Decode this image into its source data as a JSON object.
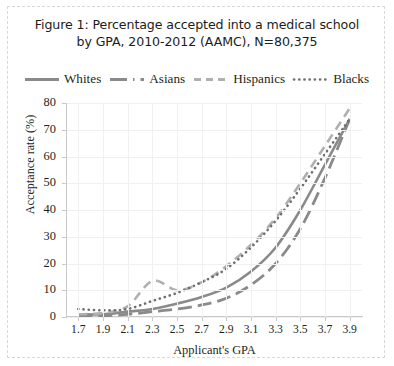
{
  "figure": {
    "title_line1": "Figure 1: Percentage accepted into a medical school",
    "title_line2": "by GPA, 2010-2012 (AAMC), N=80,375",
    "border_color": "#d8d8d8",
    "background": "#ffffff"
  },
  "chart_data": {
    "type": "line",
    "title": "Figure 1: Percentage accepted into a medical school by GPA, 2010-2012 (AAMC), N=80,375",
    "xlabel": "Applicant's GPA",
    "ylabel": "Acceptance rate (%)",
    "xlim": [
      1.6,
      4.0
    ],
    "ylim": [
      0,
      80
    ],
    "yticks": [
      0,
      10,
      20,
      30,
      40,
      50,
      60,
      70,
      80
    ],
    "xticks": [
      "1.7",
      "1.9",
      "2.1",
      "2.3",
      "2.5",
      "2.7",
      "2.9",
      "3.1",
      "3.3",
      "3.5",
      "3.7",
      "3.9"
    ],
    "x": [
      1.7,
      1.9,
      2.1,
      2.3,
      2.5,
      2.7,
      2.9,
      3.1,
      3.3,
      3.5,
      3.7,
      3.9
    ],
    "grid": true,
    "legend_position": "top",
    "series": [
      {
        "name": "Whites",
        "style": "solid",
        "color": "#8a8a8a",
        "values": [
          1.0,
          1.0,
          2.0,
          3.0,
          5.0,
          7.5,
          11.0,
          17.0,
          26.0,
          40.0,
          57.0,
          74.0
        ]
      },
      {
        "name": "Asians",
        "style": "dash-dot",
        "color": "#8a8a8a",
        "values": [
          0.5,
          0.5,
          1.0,
          2.0,
          3.0,
          4.5,
          7.0,
          12.0,
          20.0,
          33.0,
          52.0,
          74.0
        ]
      },
      {
        "name": "Hispanics",
        "style": "dashed",
        "color": "#b0b0b0",
        "values": [
          1.0,
          1.5,
          4.0,
          13.5,
          10.0,
          13.0,
          19.0,
          27.0,
          37.0,
          50.0,
          64.0,
          78.0
        ]
      },
      {
        "name": "Blacks",
        "style": "dotted",
        "color": "#6f6f6f",
        "values": [
          3.0,
          2.5,
          3.0,
          6.0,
          9.0,
          13.0,
          18.0,
          26.0,
          36.0,
          48.0,
          61.0,
          74.0
        ]
      }
    ]
  }
}
